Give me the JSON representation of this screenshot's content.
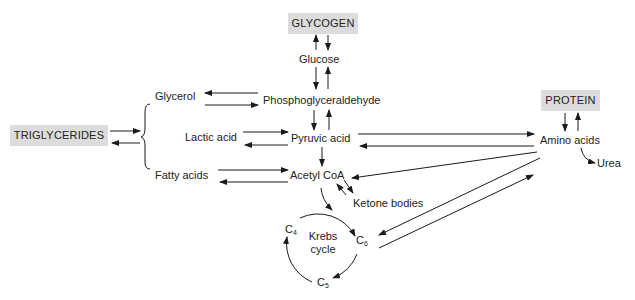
{
  "diagram": {
    "type": "metabolic pathway",
    "storage": {
      "glycogen": "GLYCOGEN",
      "triglycerides": "TRIGLYCERIDES",
      "protein": "PROTEIN"
    },
    "nodes": {
      "glucose": "Glucose",
      "phosphoglyceraldehyde": "Phosphoglyceraldehyde",
      "glycerol": "Glycerol",
      "lactic_acid": "Lactic acid",
      "pyruvic_acid": "Pyruvic acid",
      "fatty_acids": "Fatty acids",
      "acetyl_coa": "Acetyl CoA",
      "ketone_bodies": "Ketone bodies",
      "amino_acids": "Amino acids",
      "urea": "Urea",
      "krebs_line1": "Krebs",
      "krebs_line2": "cycle",
      "c4_base": "C",
      "c4_sub": "4",
      "c5_base": "C",
      "c5_sub": "5",
      "c6_base": "C",
      "c6_sub": "6"
    },
    "colors": {
      "box_fill": "#dcdcdc",
      "line": "#1a1a1a"
    },
    "edges": [
      {
        "from": "GLYCOGEN",
        "to": "Glucose",
        "bidirectional": true
      },
      {
        "from": "Glucose",
        "to": "Phosphoglyceraldehyde",
        "bidirectional": true
      },
      {
        "from": "Glycerol",
        "to": "Phosphoglyceraldehyde",
        "bidirectional": true
      },
      {
        "from": "Phosphoglyceraldehyde",
        "to": "Pyruvic acid",
        "bidirectional": true
      },
      {
        "from": "Lactic acid",
        "to": "Pyruvic acid",
        "bidirectional": true
      },
      {
        "from": "Pyruvic acid",
        "to": "Acetyl CoA",
        "bidirectional": false
      },
      {
        "from": "Fatty acids",
        "to": "Acetyl CoA",
        "bidirectional": true
      },
      {
        "from": "TRIGLYCERIDES",
        "to": "Glycerol + Lactic acid + Fatty acids",
        "bidirectional": true
      },
      {
        "from": "Acetyl CoA",
        "to": "Ketone bodies",
        "bidirectional": true
      },
      {
        "from": "Acetyl CoA",
        "to": "Krebs cycle",
        "bidirectional": false
      },
      {
        "from": "Pyruvic acid",
        "to": "Amino acids",
        "bidirectional": true
      },
      {
        "from": "Amino acids",
        "to": "Acetyl CoA",
        "bidirectional": false
      },
      {
        "from": "Amino acids",
        "to": "C6",
        "bidirectional": false
      },
      {
        "from": "C6",
        "to": "Amino acids",
        "bidirectional": false
      },
      {
        "from": "PROTEIN",
        "to": "Amino acids",
        "bidirectional": true
      },
      {
        "from": "Amino acids",
        "to": "Urea",
        "bidirectional": false
      }
    ]
  }
}
